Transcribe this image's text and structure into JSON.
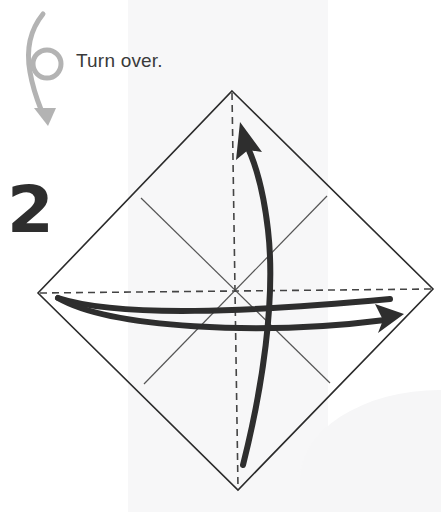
{
  "instruction": {
    "icon": "turn-over-icon",
    "text": "Turn over."
  },
  "step": {
    "number": "2"
  },
  "diagram": {
    "shape": "square rotated 45deg (diamond)",
    "vertices": {
      "top": [
        232,
        91
      ],
      "right": [
        433,
        289
      ],
      "bottom": [
        238,
        490
      ],
      "left": [
        38,
        293
      ]
    },
    "creases": [
      {
        "type": "valley-fold dashed",
        "orientation": "vertical"
      },
      {
        "type": "valley-fold dashed",
        "orientation": "horizontal"
      },
      {
        "type": "existing crease",
        "orientation": "diagonal"
      },
      {
        "type": "existing crease",
        "orientation": "anti-diagonal"
      }
    ],
    "arrows": [
      {
        "name": "fold-up-arrow",
        "direction": "up"
      },
      {
        "name": "fold-right-arrow",
        "direction": "right"
      }
    ],
    "colors": {
      "line": "#2b2b2b",
      "arrow": "#2e2e2e",
      "turn_arrow": "#b3b3b3"
    }
  }
}
